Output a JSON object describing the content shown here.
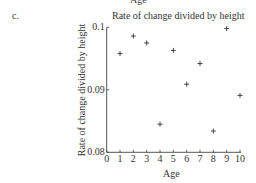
{
  "figure": {
    "top_cut_label": "Age",
    "panel_label": "c."
  },
  "chart_data": {
    "type": "scatter",
    "title": "Rate of change divided by height",
    "xlabel": "Age",
    "ylabel": "Rate of change divided by height",
    "xlim": [
      0,
      10
    ],
    "ylim": [
      0.08,
      0.1
    ],
    "x_ticks": [
      0,
      1,
      2,
      3,
      4,
      5,
      6,
      7,
      8,
      9,
      10
    ],
    "y_ticks": [
      0.08,
      0.09,
      0.1
    ],
    "y_tick_labels": [
      "0.08",
      "0.09",
      "0.1"
    ],
    "grid": false,
    "marker": "+",
    "series": [
      {
        "name": "Rate of change divided by height",
        "x": [
          1,
          2,
          3,
          4,
          5,
          6,
          7,
          8,
          9,
          10
        ],
        "y": [
          0.0958,
          0.0986,
          0.0975,
          0.0845,
          0.0963,
          0.0909,
          0.0942,
          0.0834,
          0.0998,
          0.0891
        ]
      }
    ]
  }
}
